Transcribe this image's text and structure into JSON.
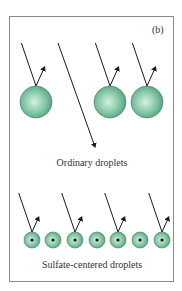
{
  "panel_label": "(b)",
  "colors": {
    "droplet_light": "#c9ebdb",
    "droplet_mid": "#7cc4a2",
    "droplet_dark": "#3f8a6a",
    "frame": "#8a8a8a",
    "line": "#1a1a1a"
  },
  "ordinary": {
    "label": "Ordinary droplets",
    "droplets": [
      {
        "cx": 36,
        "cy": 102,
        "r": 16,
        "reflects": true
      },
      {
        "cx": 110,
        "cy": 102,
        "r": 16,
        "reflects": true
      },
      {
        "cx": 147,
        "cy": 102,
        "r": 16,
        "reflects": true
      }
    ],
    "transmitted_ray": {
      "x1": 58,
      "y1": 43,
      "x2": 95,
      "y2": 147
    }
  },
  "sulfate": {
    "label": "Sulfate-centered droplets",
    "droplets": [
      {
        "cx": 32,
        "cy": 240,
        "r": 8,
        "reflects": true
      },
      {
        "cx": 53,
        "cy": 240,
        "r": 8,
        "reflects": false
      },
      {
        "cx": 75,
        "cy": 240,
        "r": 8,
        "reflects": true
      },
      {
        "cx": 97,
        "cy": 240,
        "r": 8,
        "reflects": false
      },
      {
        "cx": 118,
        "cy": 240,
        "r": 8,
        "reflects": true
      },
      {
        "cx": 140,
        "cy": 240,
        "r": 8,
        "reflects": false
      },
      {
        "cx": 162,
        "cy": 240,
        "r": 8,
        "reflects": true
      }
    ]
  }
}
